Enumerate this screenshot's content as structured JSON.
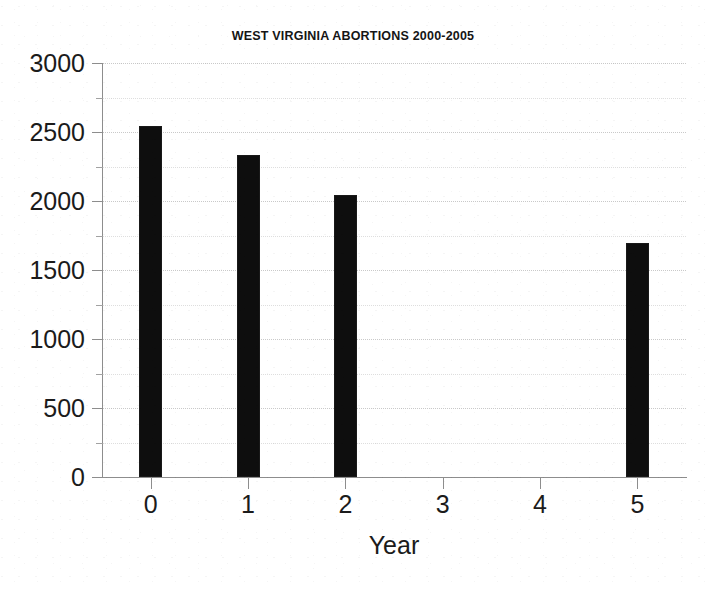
{
  "chart_data": {
    "type": "bar",
    "title": "WEST VIRGINIA ABORTIONS 2000-2005",
    "xlabel": "Year",
    "ylabel": "",
    "categories": [
      "0",
      "1",
      "2",
      "3",
      "4",
      "5"
    ],
    "values": [
      2547,
      2333,
      2043,
      0,
      0,
      1696
    ],
    "series": [
      {
        "name": "Abortions",
        "values": [
          2547,
          2333,
          2043,
          0,
          0,
          1696
        ]
      }
    ],
    "ylim": [
      0,
      3000
    ],
    "xlim": [
      -0.5,
      5.5
    ],
    "y_ticks": [
      0,
      500,
      1000,
      1500,
      2000,
      2500,
      3000
    ],
    "y_tick_labels": [
      "0",
      "500",
      "1000",
      "1500",
      "2000",
      "2500",
      "3000"
    ],
    "y_minor_ticks": [
      250,
      750,
      1250,
      1750,
      2250,
      2750
    ],
    "x_ticks": [
      0,
      1,
      2,
      3,
      4,
      5
    ],
    "x_tick_labels": [
      "0",
      "1",
      "2",
      "3",
      "4",
      "5"
    ],
    "grid": true,
    "grid_axis": "y",
    "grid_style": "dotted",
    "legend": false,
    "legend_position": "none",
    "bar_color": "#0e0e0e",
    "grid_color": "#c9c9c9",
    "axis_color": "#8d8d8d",
    "background_color": "#ffffff",
    "annotations": []
  }
}
